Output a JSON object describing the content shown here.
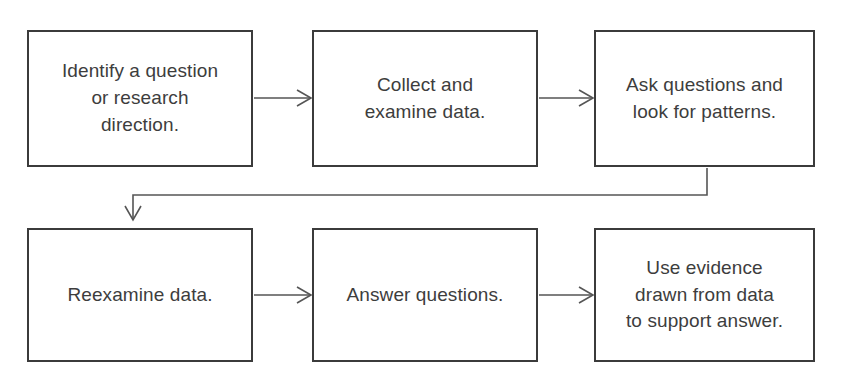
{
  "diagram": {
    "type": "flowchart",
    "orientation": "horizontal-snake",
    "background_color": "#ffffff",
    "box_border_color": "#3b3b3b",
    "text_color": "#3d3d3d",
    "connector_color": "#555555",
    "nodes": [
      {
        "id": "identify-question",
        "label": "Identify a question\nor research\ndirection.",
        "row": 1,
        "order": 1
      },
      {
        "id": "collect-examine",
        "label": "Collect and\nexamine data.",
        "row": 1,
        "order": 2
      },
      {
        "id": "ask-questions",
        "label": "Ask questions and\nlook for patterns.",
        "row": 1,
        "order": 3
      },
      {
        "id": "reexamine-data",
        "label": "Reexamine data.",
        "row": 2,
        "order": 4
      },
      {
        "id": "answer-questions",
        "label": "Answer questions.",
        "row": 2,
        "order": 5
      },
      {
        "id": "use-evidence",
        "label": "Use evidence\ndrawn from data\nto support answer.",
        "row": 2,
        "order": 6
      }
    ],
    "connectors": [
      {
        "id": "c1",
        "from": "identify-question",
        "to": "collect-examine",
        "style": "straight-right"
      },
      {
        "id": "c2",
        "from": "collect-examine",
        "to": "ask-questions",
        "style": "straight-right"
      },
      {
        "id": "c3",
        "from": "ask-questions",
        "to": "reexamine-data",
        "style": "elbow-wrap-down-left"
      },
      {
        "id": "c4",
        "from": "reexamine-data",
        "to": "answer-questions",
        "style": "straight-right"
      },
      {
        "id": "c5",
        "from": "answer-questions",
        "to": "use-evidence",
        "style": "straight-right"
      }
    ]
  }
}
